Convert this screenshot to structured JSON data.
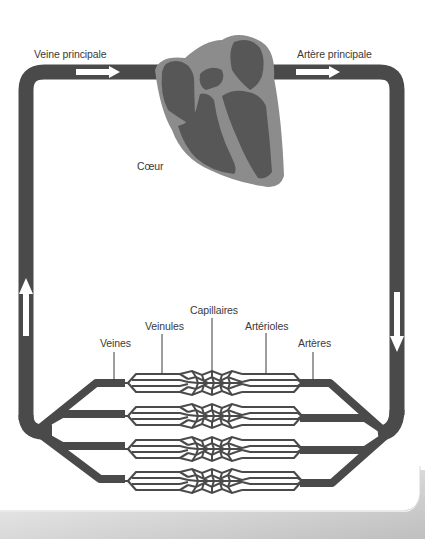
{
  "diagram": {
    "colors": {
      "background": "#ffffff",
      "vessel": "#4a4a4a",
      "heart_outer": "#8c8c8c",
      "heart_inner": "#575757",
      "arrow": "#ffffff",
      "label": "#3a3a3a",
      "page_shadow": "#9a9a9a"
    },
    "labels": {
      "main_vein": "Veine principale",
      "main_artery": "Artère principale",
      "heart": "Cœur",
      "capillaries": "Capillaires",
      "venules": "Veinules",
      "arterioles": "Artérioles",
      "veins": "Veines",
      "arteries": "Artères"
    },
    "arrows": [
      {
        "id": "main-vein-arrow",
        "direction": "right"
      },
      {
        "id": "main-artery-arrow",
        "direction": "right"
      },
      {
        "id": "descending-artery-arrow",
        "direction": "down"
      },
      {
        "id": "ascending-vein-arrow",
        "direction": "up"
      }
    ],
    "capillary_beds": 4
  }
}
